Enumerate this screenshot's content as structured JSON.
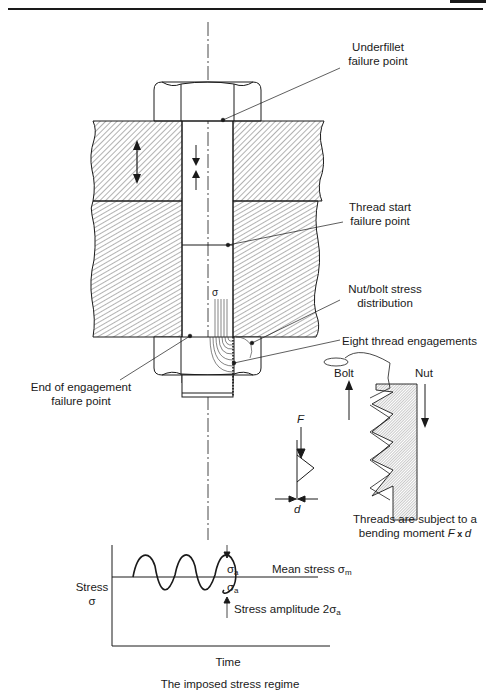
{
  "page": {
    "header_rule": true,
    "page_tab": ""
  },
  "labels": {
    "underfillet": {
      "line1": "Underfillet",
      "line2": "failure point"
    },
    "thread_start": {
      "line1": "Thread start",
      "line2": "failure point"
    },
    "nut_bolt_stress": {
      "line1": "Nut/bolt stress",
      "line2": "distribution"
    },
    "eight_thread": "Eight thread engagements",
    "end_of_engagement": {
      "line1": "End of engagement",
      "line2": "failure point"
    },
    "sigma_stress_dist": "σ",
    "bolt": "Bolt",
    "nut": "Nut",
    "force": "F",
    "distance": "d",
    "bending": {
      "line1": "Threads are subject to a",
      "line2_prefix": "bending moment ",
      "line2_f": "F",
      "line2_x": " x ",
      "line2_d": "d"
    }
  },
  "stress_plot": {
    "ylabel_line1": "Stress",
    "ylabel_line2": "σ",
    "xlabel": "Time",
    "sigma_a_top": "σ",
    "sigma_a_top_sub": "a",
    "sigma_a_bottom": "σ",
    "sigma_a_bottom_sub": "a",
    "mean_stress": "Mean stress σ",
    "mean_stress_sub": "m",
    "amplitude": "Stress amplitude 2σ",
    "amplitude_sub": "a",
    "caption": "The imposed stress regime",
    "cycles": 3
  },
  "colors": {
    "ink": "#1a1a1a",
    "hatch": "#555555",
    "paper": "#ffffff"
  }
}
